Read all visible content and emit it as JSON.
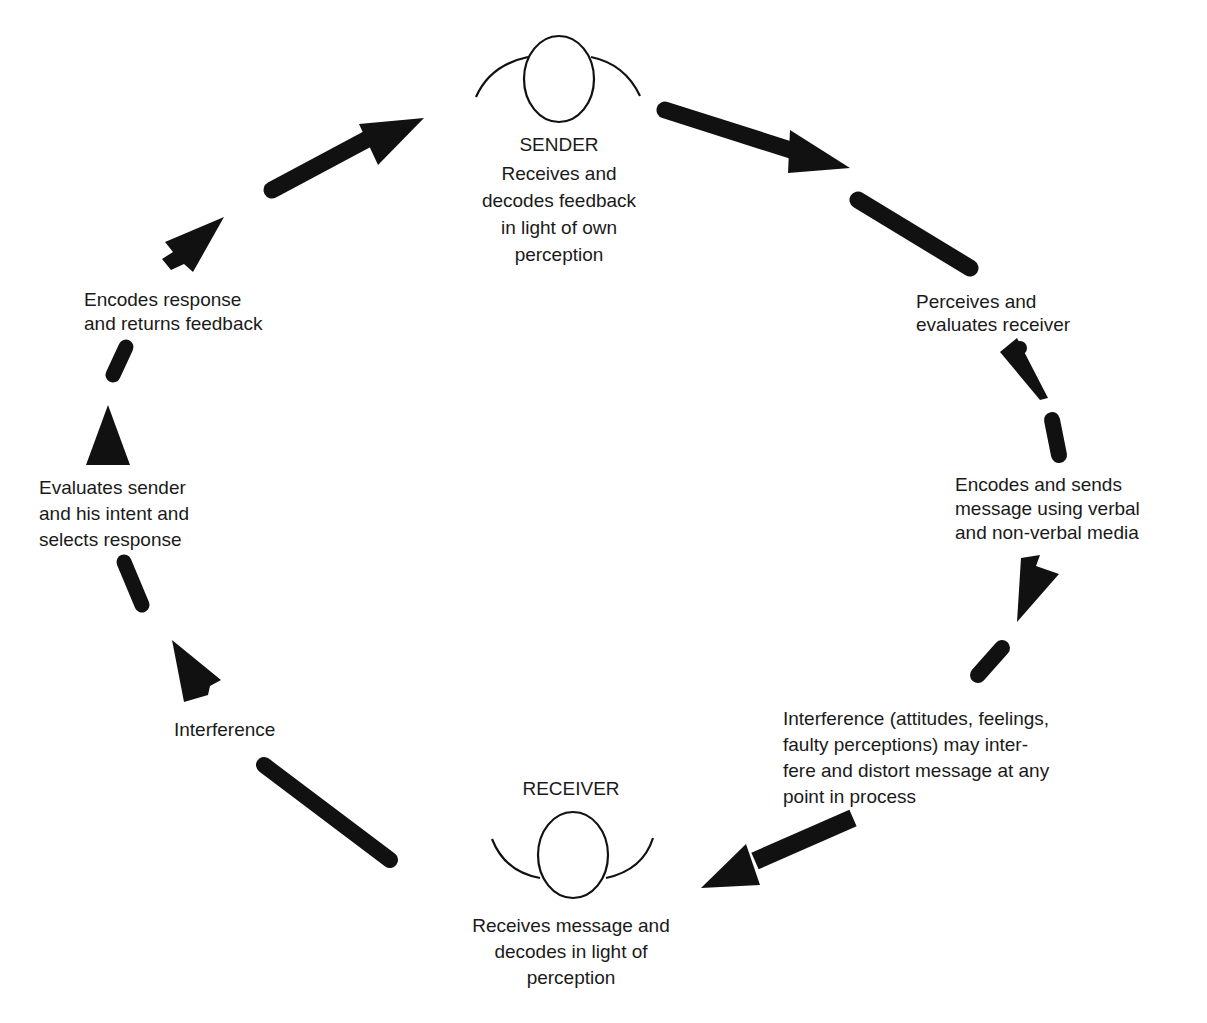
{
  "diagram": {
    "type": "cycle",
    "nodes": {
      "sender": {
        "title": "SENDER",
        "description": "Receives and\ndecodes feedback\nin light of own\nperception"
      },
      "receiver": {
        "title": "RECEIVER",
        "description": "Receives message and\ndecodes in light of\nperception"
      }
    },
    "steps": [
      {
        "id": "perceives",
        "text": "Perceives and\nevaluates receiver"
      },
      {
        "id": "encodes-sends",
        "text": "Encodes and sends\nmessage using verbal\nand non-verbal media"
      },
      {
        "id": "interference-right",
        "text": "Interference (attitudes, feelings,\nfaulty perceptions) may inter-\nfere and distort message at any\npoint in process"
      },
      {
        "id": "interference-left",
        "text": "Interference"
      },
      {
        "id": "evaluates-sender",
        "text": "Evaluates sender\nand his intent and\nselects response"
      },
      {
        "id": "encodes-response",
        "text": "Encodes response\nand returns feedback"
      }
    ],
    "colors": {
      "arrow": "#111111",
      "text": "#1a1a1a",
      "background": "#ffffff"
    }
  }
}
